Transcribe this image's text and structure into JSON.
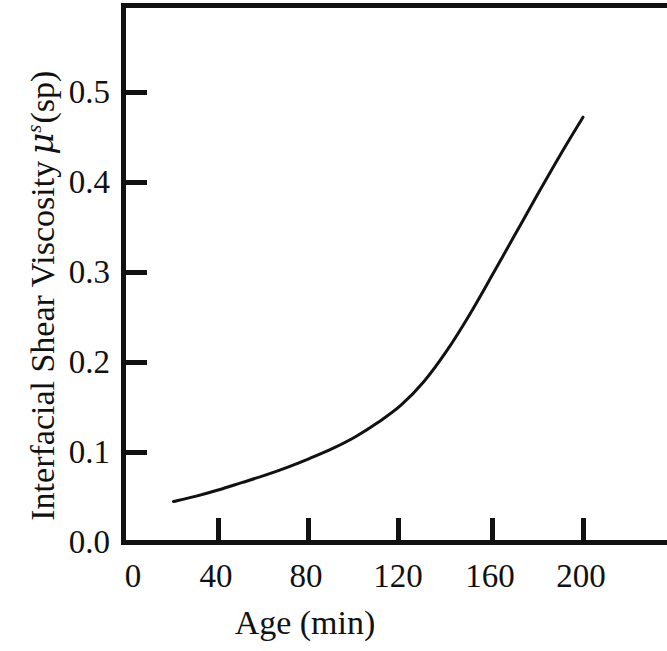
{
  "figure": {
    "background_color": "#ffffff",
    "ink_color": "#111111"
  },
  "axes": {
    "x_title": "Age (min)",
    "y_title_prefix": "Interfacial Shear Viscosity",
    "y_title_symbol": "μ",
    "y_title_superscript": "s",
    "y_title_suffix": "(sp)",
    "x_ticks": [
      "0",
      "40",
      "80",
      "120",
      "160",
      "200"
    ],
    "y_ticks": [
      "0.0",
      "0.1",
      "0.2",
      "0.3",
      "0.4",
      "0.5"
    ]
  },
  "chart_data": {
    "type": "line",
    "title": "",
    "xlabel": "Age (min)",
    "ylabel": "Interfacial Shear Viscosity μ^s(sp)",
    "xlim": [
      0,
      213
    ],
    "ylim": [
      0.0,
      0.6
    ],
    "xticks": [
      0,
      40,
      80,
      120,
      160,
      200
    ],
    "yticks": [
      0.0,
      0.1,
      0.2,
      0.3,
      0.4,
      0.5
    ],
    "grid": false,
    "legend": null,
    "tick_direction": "in",
    "series": [
      {
        "name": "Interfacial shear viscosity vs age",
        "color": "#111111",
        "linewidth": 3,
        "x": [
          20,
          30,
          40,
          50,
          60,
          70,
          80,
          90,
          100,
          110,
          120,
          130,
          140,
          150,
          160,
          170,
          180,
          190,
          200
        ],
        "y": [
          0.045,
          0.051,
          0.058,
          0.066,
          0.074,
          0.083,
          0.093,
          0.104,
          0.117,
          0.133,
          0.152,
          0.178,
          0.212,
          0.252,
          0.296,
          0.341,
          0.386,
          0.43,
          0.472
        ]
      }
    ]
  }
}
